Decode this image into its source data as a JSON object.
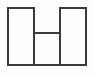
{
  "document": {
    "title": "H Shape Diagram",
    "kind": "line-drawing",
    "description": "Monochrome outline drawing of an H-shaped figure"
  },
  "canvas": {
    "width": 94,
    "height": 76,
    "background_color": "#fdfdfc",
    "outer_background_color": "#ffffff"
  },
  "style": {
    "stroke_color": "#3a3a3a",
    "stroke_width": 2,
    "fill_color": "#fdfdfc",
    "line_cap": "butt",
    "line_join": "miter"
  },
  "figure": {
    "name": "h-shape",
    "bounds": {
      "left": 8,
      "top": 8,
      "right": 86,
      "bottom": 65,
      "width": 78,
      "height": 57
    },
    "outline_path": "M 8 8 L 34 8 L 34 65 L 60 65 L 60 8 L 86 8 L 86 65 L 8 65 Z",
    "segments": [
      {
        "name": "top-left-edge",
        "orientation": "horizontal",
        "x1": 8,
        "y1": 8,
        "x2": 34,
        "y2": 8
      },
      {
        "name": "top-right-edge",
        "orientation": "horizontal",
        "x1": 60,
        "y1": 8,
        "x2": 86,
        "y2": 8
      },
      {
        "name": "left-outer-edge",
        "orientation": "vertical",
        "x1": 8,
        "y1": 8,
        "x2": 8,
        "y2": 65
      },
      {
        "name": "right-outer-edge",
        "orientation": "vertical",
        "x1": 86,
        "y1": 8,
        "x2": 86,
        "y2": 65
      },
      {
        "name": "bottom-edge",
        "orientation": "horizontal",
        "x1": 8,
        "y1": 65,
        "x2": 86,
        "y2": 65
      },
      {
        "name": "left-inner-divider",
        "orientation": "vertical",
        "x1": 34,
        "y1": 8,
        "x2": 34,
        "y2": 65
      },
      {
        "name": "right-inner-divider",
        "orientation": "vertical",
        "x1": 60,
        "y1": 8,
        "x2": 60,
        "y2": 65
      },
      {
        "name": "crossbar",
        "orientation": "horizontal",
        "x1": 34,
        "y1": 33,
        "x2": 60,
        "y2": 33
      }
    ],
    "notch": {
      "name": "top-center-opening",
      "left": 34,
      "right": 60,
      "top": 8,
      "bottom": 33,
      "open_side": "top"
    },
    "regions": [
      {
        "name": "left-column",
        "left": 8,
        "top": 8,
        "right": 34,
        "bottom": 65
      },
      {
        "name": "center-lower-cell",
        "left": 34,
        "top": 33,
        "right": 60,
        "bottom": 65
      },
      {
        "name": "right-column",
        "left": 60,
        "top": 8,
        "right": 86,
        "bottom": 65
      }
    ]
  }
}
